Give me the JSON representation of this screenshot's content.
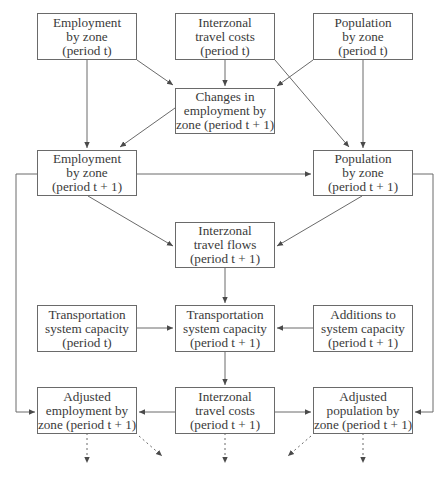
{
  "diagram": {
    "type": "flowchart",
    "nodes": {
      "emp_t": {
        "lines": [
          "Employment",
          "by zone",
          "(period t)"
        ]
      },
      "cost_t": {
        "lines": [
          "Interzonal",
          "travel costs",
          "(period t)"
        ]
      },
      "pop_t": {
        "lines": [
          "Population",
          "by zone",
          "(period t)"
        ]
      },
      "chg_emp": {
        "lines": [
          "Changes in",
          "employment by",
          "zone (period t + 1)"
        ]
      },
      "emp_t1": {
        "lines": [
          "Employment",
          "by zone",
          "(period t + 1)"
        ]
      },
      "pop_t1": {
        "lines": [
          "Population",
          "by zone",
          "(period t + 1)"
        ]
      },
      "flows_t1": {
        "lines": [
          "Interzonal",
          "travel flows",
          "(period t + 1)"
        ]
      },
      "cap_t": {
        "lines": [
          "Transportation",
          "system capacity",
          "(period t)"
        ]
      },
      "cap_t1": {
        "lines": [
          "Transportation",
          "system capacity",
          "(period t + 1)"
        ]
      },
      "add_cap": {
        "lines": [
          "Additions to",
          "system capacity",
          "(period t + 1)"
        ]
      },
      "adj_emp": {
        "lines": [
          "Adjusted",
          "employment by",
          "zone (period t + 1)"
        ]
      },
      "cost_t1": {
        "lines": [
          "Interzonal",
          "travel costs",
          "(period t + 1)"
        ]
      },
      "adj_pop": {
        "lines": [
          "Adjusted",
          "population by",
          "zone (period t + 1)"
        ]
      }
    },
    "edges": [
      {
        "from": "emp_t",
        "to": "emp_t1",
        "style": "solid"
      },
      {
        "from": "emp_t",
        "to": "chg_emp",
        "style": "solid"
      },
      {
        "from": "cost_t",
        "to": "chg_emp",
        "style": "solid"
      },
      {
        "from": "cost_t",
        "to": "pop_t1",
        "style": "solid"
      },
      {
        "from": "pop_t",
        "to": "chg_emp",
        "style": "solid"
      },
      {
        "from": "pop_t",
        "to": "pop_t1",
        "style": "solid"
      },
      {
        "from": "chg_emp",
        "to": "emp_t1",
        "style": "solid"
      },
      {
        "from": "emp_t1",
        "to": "pop_t1",
        "style": "solid"
      },
      {
        "from": "emp_t1",
        "to": "flows_t1",
        "style": "solid"
      },
      {
        "from": "pop_t1",
        "to": "flows_t1",
        "style": "solid"
      },
      {
        "from": "emp_t1",
        "to": "adj_emp",
        "style": "solid"
      },
      {
        "from": "pop_t1",
        "to": "adj_pop",
        "style": "solid"
      },
      {
        "from": "flows_t1",
        "to": "cap_t1",
        "style": "solid"
      },
      {
        "from": "cap_t",
        "to": "cap_t1",
        "style": "solid"
      },
      {
        "from": "add_cap",
        "to": "cap_t1",
        "style": "solid"
      },
      {
        "from": "cap_t1",
        "to": "cost_t1",
        "style": "solid"
      },
      {
        "from": "cost_t1",
        "to": "adj_emp",
        "style": "solid"
      },
      {
        "from": "cost_t1",
        "to": "adj_pop",
        "style": "solid"
      },
      {
        "from": "adj_emp",
        "to": "next",
        "style": "dotted"
      },
      {
        "from": "adj_emp",
        "to": "next",
        "style": "dotted"
      },
      {
        "from": "cost_t1",
        "to": "next",
        "style": "dotted"
      },
      {
        "from": "adj_pop",
        "to": "next",
        "style": "dotted"
      },
      {
        "from": "adj_pop",
        "to": "next",
        "style": "dotted"
      }
    ],
    "colors": {
      "stroke": "#6a6a6a",
      "text": "#3a3a3a",
      "background": "#ffffff"
    }
  }
}
